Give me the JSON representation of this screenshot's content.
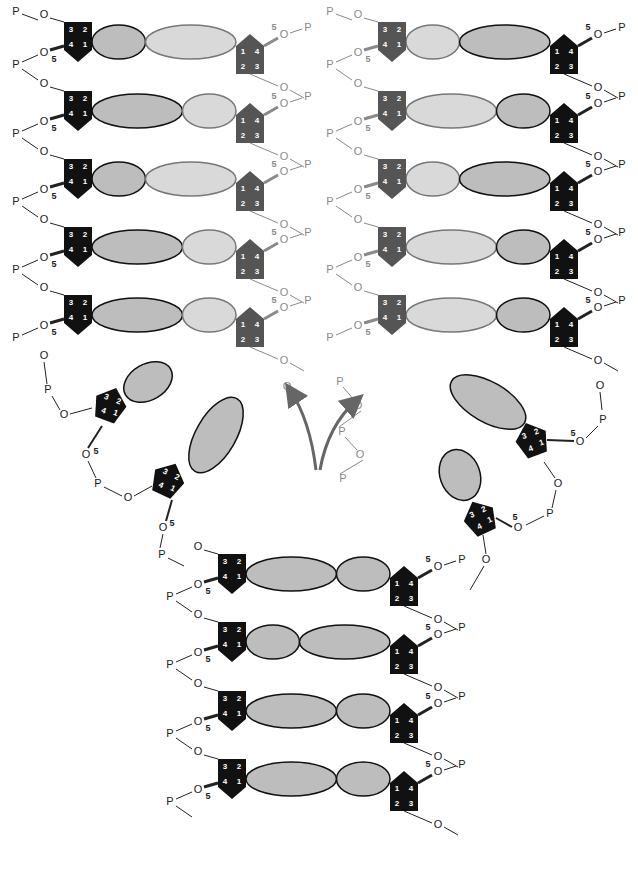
{
  "diagram": {
    "colors": {
      "old_sugar": "#111111",
      "new_sugar": "#555555",
      "old_base_fill": "#bdbdbd",
      "new_base_fill": "#d9d9d9",
      "old_backbone": "#222222",
      "new_backbone": "#8a8a8a",
      "arrow": "#666666",
      "sugar_number": "#ffffff"
    },
    "labels": {
      "phosphate": "P",
      "oxygen": "O",
      "five_prime": "5",
      "sugar_numbers": [
        "1",
        "2",
        "3",
        "4"
      ]
    },
    "left_helix": {
      "rows_y": [
        48,
        117,
        185,
        253,
        321
      ],
      "left_sugar_x": 78,
      "right_sugar_x": 250,
      "left_sugar_color": "old",
      "right_sugar_color": "new",
      "pairs": [
        {
          "a": {
            "w": 52,
            "fill": "old"
          },
          "b": {
            "w": 88,
            "fill": "new"
          }
        },
        {
          "a": {
            "w": 88,
            "fill": "old"
          },
          "b": {
            "w": 52,
            "fill": "new"
          }
        },
        {
          "a": {
            "w": 52,
            "fill": "old"
          },
          "b": {
            "w": 88,
            "fill": "new"
          }
        },
        {
          "a": {
            "w": 88,
            "fill": "old"
          },
          "b": {
            "w": 52,
            "fill": "new"
          }
        },
        {
          "a": {
            "w": 88,
            "fill": "old"
          },
          "b": {
            "w": 52,
            "fill": "new"
          }
        }
      ]
    },
    "right_helix": {
      "rows_y": [
        48,
        117,
        185,
        253,
        321
      ],
      "left_sugar_x": 392,
      "right_sugar_x": 564,
      "left_sugar_color": "new",
      "right_sugar_color": "old",
      "pairs": [
        {
          "a": {
            "w": 52,
            "fill": "new"
          },
          "b": {
            "w": 88,
            "fill": "old"
          }
        },
        {
          "a": {
            "w": 88,
            "fill": "new"
          },
          "b": {
            "w": 52,
            "fill": "old"
          }
        },
        {
          "a": {
            "w": 52,
            "fill": "new"
          },
          "b": {
            "w": 88,
            "fill": "old"
          }
        },
        {
          "a": {
            "w": 88,
            "fill": "new"
          },
          "b": {
            "w": 52,
            "fill": "old"
          }
        },
        {
          "a": {
            "w": 88,
            "fill": "new"
          },
          "b": {
            "w": 52,
            "fill": "old"
          }
        }
      ]
    },
    "bottom_helix": {
      "rows_y": [
        580,
        648,
        717,
        785
      ],
      "left_sugar_x": 232,
      "right_sugar_x": 404,
      "left_sugar_color": "old",
      "right_sugar_color": "old",
      "pairs": [
        {
          "a": {
            "w": 88,
            "fill": "old"
          },
          "b": {
            "w": 52,
            "fill": "old"
          }
        },
        {
          "a": {
            "w": 52,
            "fill": "old"
          },
          "b": {
            "w": 88,
            "fill": "old"
          }
        },
        {
          "a": {
            "w": 88,
            "fill": "old"
          },
          "b": {
            "w": 52,
            "fill": "old"
          }
        },
        {
          "a": {
            "w": 88,
            "fill": "old"
          },
          "b": {
            "w": 52,
            "fill": "old"
          }
        }
      ]
    },
    "unpaired_left": [
      {
        "x": 110,
        "y": 405,
        "rot": 20,
        "base": {
          "cx": 148,
          "cy": 382,
          "rx": 26,
          "ry": 18,
          "rot": -30
        }
      },
      {
        "x": 168,
        "y": 480,
        "rot": 25,
        "base": {
          "cx": 216,
          "cy": 435,
          "rx": 20,
          "ry": 42,
          "rot": 30
        }
      }
    ],
    "unpaired_right": [
      {
        "x": 532,
        "y": 440,
        "rot": -20,
        "base": {
          "cx": 488,
          "cy": 402,
          "rx": 42,
          "ry": 20,
          "rot": 30
        }
      },
      {
        "x": 480,
        "y": 518,
        "rot": -25,
        "base": {
          "cx": 460,
          "cy": 475,
          "rx": 20,
          "ry": 26,
          "rot": -20
        }
      }
    ],
    "arrows": [
      {
        "from": [
          316,
          470
        ],
        "to": [
          290,
          390
        ]
      },
      {
        "from": [
          320,
          470
        ],
        "to": [
          357,
          400
        ]
      }
    ],
    "free_chain": {
      "nodes": [
        {
          "t": "P",
          "x": 340,
          "y": 382
        },
        {
          "t": "O",
          "x": 358,
          "y": 406
        },
        {
          "t": "P",
          "x": 342,
          "y": 432
        },
        {
          "t": "O",
          "x": 360,
          "y": 455
        },
        {
          "t": "P",
          "x": 343,
          "y": 479
        }
      ]
    }
  }
}
